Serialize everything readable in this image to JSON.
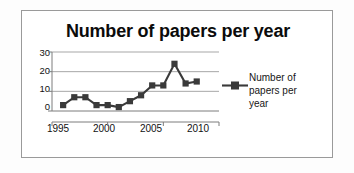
{
  "chart_data": {
    "type": "line",
    "title": "Number of papers per year",
    "xlabel": "",
    "ylabel": "",
    "x": [
      1996,
      1997,
      1998,
      1999,
      2000,
      2001,
      2002,
      2003,
      2004,
      2005,
      2006,
      2007,
      2008
    ],
    "values": [
      3,
      7,
      7,
      3,
      3,
      2,
      5,
      8,
      13,
      13,
      24,
      14,
      15
    ],
    "series": [
      {
        "name": "Number of papers per year",
        "values": [
          3,
          7,
          7,
          3,
          3,
          2,
          5,
          8,
          13,
          13,
          24,
          14,
          15
        ]
      }
    ],
    "xlim": [
      1995,
      2010
    ],
    "ylim": [
      0,
      30
    ],
    "x_ticks": [
      "1995",
      "2000",
      "2005",
      "2010"
    ],
    "x_tick_values": [
      1995,
      2000,
      2005,
      2010
    ],
    "y_ticks": [
      "0",
      "10",
      "20",
      "30"
    ],
    "y_tick_values": [
      0,
      10,
      20,
      30
    ],
    "grid": "horizontal",
    "legend_position": "right",
    "marker": "square",
    "series_color": "#3a3a3a",
    "axis_color": "#7d7d7d",
    "grid_color": "#9d9d9d",
    "text_color": "#111111"
  },
  "legend": {
    "entries": [
      {
        "label": "Number of papers per year"
      }
    ]
  },
  "frame": {
    "border_color": "#9a9a9a",
    "background": "#ffffff"
  }
}
